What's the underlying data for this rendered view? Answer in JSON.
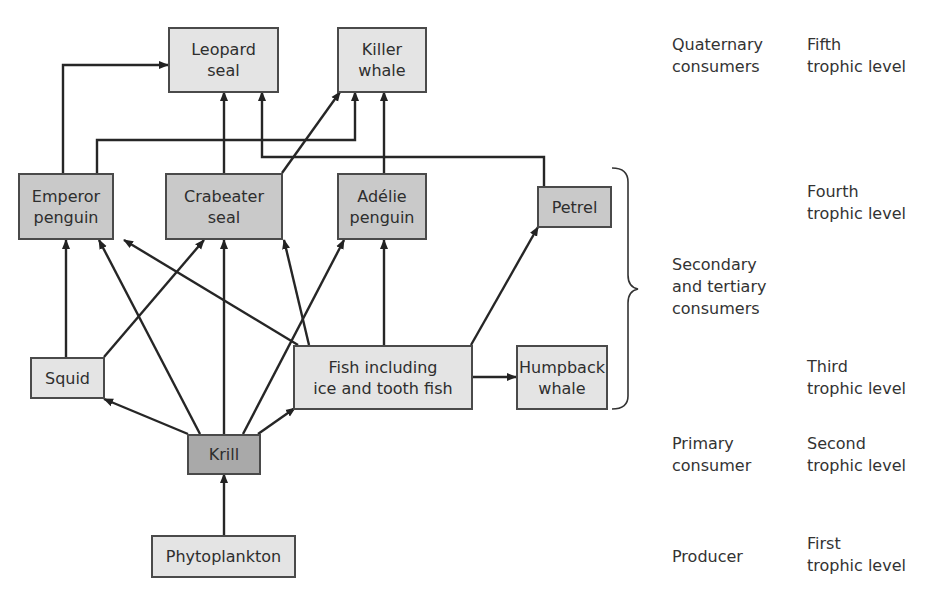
{
  "nodes": {
    "leopard_seal": "Leopard\nseal",
    "killer_whale": "Killer\nwhale",
    "emperor_penguin": "Emperor\npenguin",
    "crabeater_seal": "Crabeater\nseal",
    "adelie_penguin": "Adélie\npenguin",
    "petrel": "Petrel",
    "squid": "Squid",
    "fish": "Fish including\nice and tooth fish",
    "humpback_whale": "Humpback\nwhale",
    "krill": "Krill",
    "phytoplankton": "Phytoplankton"
  },
  "levels": {
    "quaternary": "Quaternary\nconsumers",
    "fifth": "Fifth\ntrophic level",
    "fourth": "Fourth\ntrophic level",
    "secondary_tertiary": "Secondary\nand tertiary\nconsumers",
    "third": "Third\ntrophic level",
    "primary": "Primary\nconsumer",
    "second": "Second\ntrophic level",
    "producer": "Producer",
    "first": "First\ntrophic level"
  },
  "edges": [
    [
      "Phytoplankton",
      "Krill"
    ],
    [
      "Krill",
      "Squid"
    ],
    [
      "Krill",
      "Emperor penguin"
    ],
    [
      "Krill",
      "Crabeater seal"
    ],
    [
      "Krill",
      "Adélie penguin"
    ],
    [
      "Krill",
      "Fish"
    ],
    [
      "Squid",
      "Emperor penguin"
    ],
    [
      "Squid",
      "Crabeater seal"
    ],
    [
      "Fish",
      "Emperor penguin"
    ],
    [
      "Fish",
      "Crabeater seal"
    ],
    [
      "Fish",
      "Adélie penguin"
    ],
    [
      "Fish",
      "Petrel"
    ],
    [
      "Fish",
      "Humpback whale"
    ],
    [
      "Emperor penguin",
      "Leopard seal"
    ],
    [
      "Emperor penguin",
      "Killer whale"
    ],
    [
      "Crabeater seal",
      "Leopard seal"
    ],
    [
      "Crabeater seal",
      "Killer whale"
    ],
    [
      "Adélie penguin",
      "Killer whale"
    ],
    [
      "Petrel",
      "Leopard seal"
    ]
  ]
}
